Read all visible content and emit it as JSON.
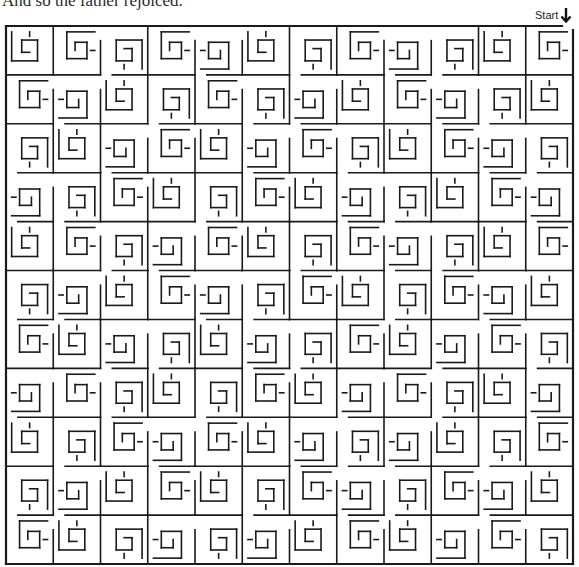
{
  "caption": "And so the father rejoiced.",
  "start": {
    "label": "Start",
    "icon": "arrow-down-icon"
  },
  "maze": {
    "stroke_color": "#1a1a1a",
    "stroke_width": 1.6,
    "border_width": 2.2,
    "left": 6,
    "top": 26,
    "right": 573,
    "bottom": 564,
    "cols": 12,
    "rows": 11,
    "start_gap": [
      562,
      573
    ],
    "orientations": [
      [
        0,
        1,
        2,
        1,
        3,
        0,
        2,
        1,
        3,
        2,
        0,
        1
      ],
      [
        1,
        3,
        0,
        2,
        1,
        2,
        3,
        0,
        1,
        3,
        2,
        0
      ],
      [
        2,
        0,
        3,
        1,
        0,
        3,
        1,
        2,
        0,
        1,
        3,
        2
      ],
      [
        3,
        2,
        1,
        0,
        2,
        1,
        0,
        3,
        2,
        0,
        1,
        3
      ],
      [
        0,
        1,
        2,
        3,
        1,
        0,
        2,
        1,
        3,
        2,
        0,
        1
      ],
      [
        2,
        3,
        0,
        1,
        3,
        2,
        1,
        0,
        2,
        1,
        3,
        0
      ],
      [
        1,
        0,
        3,
        2,
        0,
        3,
        2,
        1,
        0,
        3,
        1,
        2
      ],
      [
        3,
        1,
        2,
        0,
        2,
        1,
        0,
        3,
        1,
        2,
        0,
        3
      ],
      [
        0,
        2,
        1,
        3,
        1,
        0,
        3,
        2,
        3,
        0,
        2,
        1
      ],
      [
        2,
        3,
        0,
        1,
        0,
        2,
        1,
        3,
        2,
        1,
        3,
        0
      ],
      [
        1,
        0,
        2,
        3,
        2,
        3,
        0,
        1,
        0,
        3,
        1,
        2
      ]
    ]
  }
}
